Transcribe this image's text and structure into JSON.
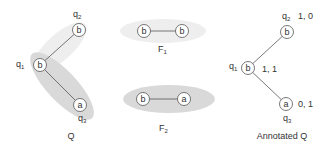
{
  "colors": {
    "edge": "#555555",
    "node_stroke": "#555555",
    "node_fill": "#ffffff",
    "highlight_light": "#eeeeee",
    "highlight_dark": "#d9d9d9",
    "text": "#333333"
  },
  "panels": {
    "q": {
      "caption": "Q",
      "nodes": [
        {
          "id": "q1",
          "label": "b",
          "name_main": "q",
          "name_sub": "1"
        },
        {
          "id": "q2",
          "label": "b",
          "name_main": "q",
          "name_sub": "2"
        },
        {
          "id": "q3",
          "label": "a",
          "name_main": "q",
          "name_sub": "3"
        }
      ],
      "edges": [
        {
          "from": "q1",
          "to": "q2"
        },
        {
          "from": "q1",
          "to": "q3"
        }
      ]
    },
    "f1": {
      "caption_main": "F",
      "caption_sub": "1",
      "nodes": [
        {
          "label": "b"
        },
        {
          "label": "b"
        }
      ]
    },
    "f2": {
      "caption_main": "F",
      "caption_sub": "2",
      "nodes": [
        {
          "label": "b"
        },
        {
          "label": "a"
        }
      ]
    },
    "annotated_q": {
      "caption": "Annotated Q",
      "nodes": [
        {
          "id": "q1",
          "label": "b",
          "name_main": "q",
          "name_sub": "1",
          "annotation": "1, 1"
        },
        {
          "id": "q2",
          "label": "b",
          "name_main": "q",
          "name_sub": "2",
          "annotation": "1, 0"
        },
        {
          "id": "q3",
          "label": "a",
          "name_main": "q",
          "name_sub": "3",
          "annotation": "0, 1"
        }
      ]
    }
  }
}
